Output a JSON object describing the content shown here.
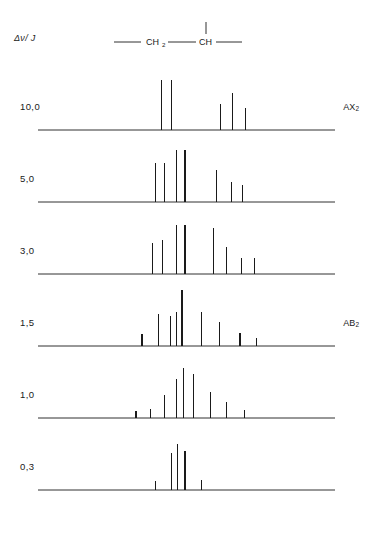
{
  "figure": {
    "axis_caption": "Δν/ J",
    "structure": {
      "ch2_label": "CH",
      "ch2_sub": "2",
      "ch_label": "CH",
      "bond_names": [
        "left-bond",
        "middle-bond",
        "right-bond",
        "up-bond"
      ]
    }
  },
  "chart_data": {
    "type": "bar",
    "xlabel": "",
    "ylabel": "",
    "axis_caption": "Δν/ J",
    "grid": false,
    "legend": "none",
    "xlim": [
      0,
      100
    ],
    "ylim": [
      0,
      100
    ],
    "series_parameter": "Δν/J",
    "panels": [
      {
        "label": "10,0",
        "tag": "AX₂",
        "tag_base": "AX",
        "tag_sub": "2",
        "x": [
          41.5,
          45.0,
          61.5,
          65.5,
          70.0
        ],
        "values": [
          86,
          86,
          44,
          64,
          38
        ]
      },
      {
        "label": "5,0",
        "tag": "",
        "tag_base": "",
        "tag_sub": "",
        "x": [
          39.5,
          42.5,
          46.5,
          49.5,
          60.0,
          65.0,
          69.0
        ],
        "values": [
          68,
          68,
          90,
          90,
          55,
          35,
          30
        ]
      },
      {
        "label": "3,0",
        "tag": "",
        "tag_base": "",
        "tag_sub": "",
        "x": [
          38.5,
          42.0,
          46.5,
          49.5,
          59.0,
          63.5,
          68.5,
          73.0
        ],
        "values": [
          54,
          58,
          84,
          84,
          80,
          46,
          28,
          28
        ]
      },
      {
        "label": "1,5",
        "tag": "AB₂",
        "tag_base": "AB",
        "tag_sub": "2",
        "x": [
          35.0,
          40.5,
          44.5,
          46.5,
          48.5,
          55.0,
          61.0,
          68.0,
          73.5
        ],
        "values": [
          20,
          56,
          52,
          58,
          96,
          58,
          42,
          22,
          14
        ]
      },
      {
        "label": "1,0",
        "tag": "",
        "tag_base": "",
        "tag_sub": "",
        "x": [
          33.0,
          38.0,
          42.5,
          46.5,
          49.0,
          52.5,
          58.0,
          63.5,
          69.5
        ],
        "values": [
          12,
          16,
          40,
          68,
          86,
          76,
          44,
          28,
          14
        ]
      },
      {
        "label": "0,3",
        "tag": "",
        "tag_base": "",
        "tag_sub": "",
        "x": [
          39.5,
          45.0,
          47.0,
          49.5,
          55.0
        ],
        "values": [
          16,
          64,
          80,
          68,
          18
        ]
      }
    ]
  }
}
